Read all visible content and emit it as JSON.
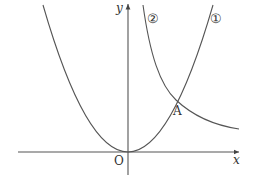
{
  "diagram": {
    "axes": {
      "x_label": "x",
      "y_label": "y",
      "origin_label": "O"
    },
    "curves": [
      {
        "id": "1",
        "label": "①",
        "type": "parabola",
        "description": "parabola with vertex at origin O"
      },
      {
        "id": "2",
        "label": "②",
        "type": "hyperbola",
        "description": "decreasing curve in first quadrant"
      }
    ],
    "points": [
      {
        "label": "A",
        "description": "intersection of curve ① and curve ②"
      }
    ],
    "colors": {
      "line": "#555555",
      "text": "#333333",
      "background": "#ffffff"
    }
  }
}
